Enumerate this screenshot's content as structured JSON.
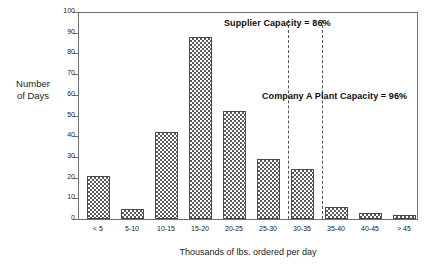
{
  "chart_data": {
    "type": "bar",
    "title": "",
    "subtitle": "",
    "xlabel": "Thousands of lbs. ordered per day",
    "ylabel": "Number\nof Days",
    "ylabel_lines": [
      "Number",
      "of Days"
    ],
    "categories": [
      "< 5",
      "5-10",
      "10-15",
      "15-20",
      "20-25",
      "25-30",
      "30-35",
      "35-40",
      "40-45",
      "> 45"
    ],
    "values": [
      21,
      5,
      42,
      88,
      52,
      29,
      24,
      6,
      3,
      2
    ],
    "ylim": [
      0,
      100
    ],
    "yticks": [
      0,
      10,
      20,
      30,
      40,
      50,
      60,
      70,
      80,
      90,
      100
    ],
    "ytick_labels": [
      "0",
      "10",
      "20",
      "30",
      "40",
      "50",
      "60",
      "70",
      "80",
      "90",
      "100"
    ],
    "grid": false,
    "legend": "none",
    "bar_fill": "checkerboard",
    "bar_edge_color": "#4a4a4a",
    "bar_pattern_color": "#5a5a5a",
    "axis_color": "#6e6e6e",
    "annotations": [
      {
        "id": "supplier-capacity",
        "text": "Supplier Capacity = 86%",
        "reference_line_category": "30-35",
        "reference_line_position": "left-edge-of-30-35"
      },
      {
        "id": "company-a-plant-capacity",
        "text": "Company A Plant Capacity = 96%",
        "reference_line_category": "35-40",
        "reference_line_position": "left-edge-of-35-40"
      }
    ]
  }
}
